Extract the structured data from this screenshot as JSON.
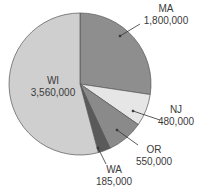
{
  "chart_data": {
    "type": "pie",
    "title": "",
    "categories": [
      "MA",
      "NJ",
      "OR",
      "WA",
      "WI"
    ],
    "values": [
      1800000,
      480000,
      550000,
      185000,
      3560000
    ],
    "value_labels": [
      "1,800,000",
      "480,000",
      "550,000",
      "185,000",
      "3,560,000"
    ],
    "colors": [
      "#8e8e8e",
      "#e6e6e6",
      "#8a8a8a",
      "#5a5a5a",
      "#cfcfcf"
    ],
    "start_angle_deg": 0,
    "direction": "clockwise",
    "legend": "none",
    "label_style": "outside with leader lines (WI inside)"
  },
  "labels": {
    "MA": {
      "name": "MA",
      "value": "1,800,000"
    },
    "NJ": {
      "name": "NJ",
      "value": "480,000"
    },
    "OR": {
      "name": "OR",
      "value": "550,000"
    },
    "WA": {
      "name": "WA",
      "value": "185,000"
    },
    "WI": {
      "name": "WI",
      "value": "3,560,000"
    }
  }
}
